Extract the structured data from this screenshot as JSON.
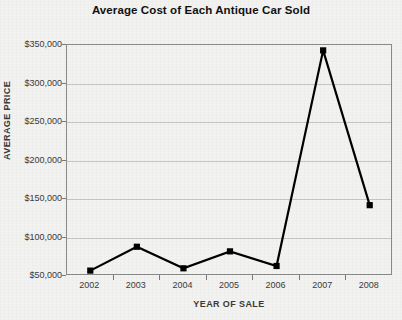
{
  "chart_data": {
    "type": "line",
    "title": "Average Cost of Each Antique Car Sold",
    "xlabel": "YEAR OF SALE",
    "ylabel": "AVERAGE PRICE",
    "categories": [
      "2002",
      "2003",
      "2004",
      "2005",
      "2006",
      "2007",
      "2008"
    ],
    "values": [
      57000,
      88000,
      60000,
      82000,
      63000,
      343000,
      142000
    ],
    "series": [
      {
        "name": "Average Price",
        "values": [
          57000,
          88000,
          60000,
          82000,
          63000,
          343000,
          142000
        ]
      }
    ],
    "ylim": [
      50000,
      350000
    ],
    "ytick_labels": [
      "$350,000",
      "$300,000",
      "$250,000",
      "$200,000",
      "$150,000",
      "$100,000",
      "$50,000"
    ],
    "ytick_values": [
      350000,
      300000,
      250000,
      200000,
      150000,
      100000,
      50000
    ],
    "grid": true,
    "legend": "none",
    "line_color": "#000000",
    "marker": "square",
    "marker_color": "#000000",
    "grid_color": "#c6c6c6",
    "background_color": "#f2f2f1"
  }
}
